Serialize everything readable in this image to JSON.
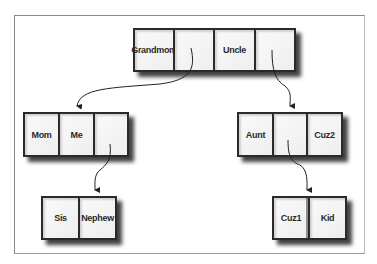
{
  "diagram": {
    "nodes": [
      {
        "id": "grandmom",
        "cells": [
          "Grandmom",
          "",
          "Uncle",
          ""
        ]
      },
      {
        "id": "mom",
        "cells": [
          "Mom",
          "Me",
          ""
        ]
      },
      {
        "id": "aunt",
        "cells": [
          "Aunt",
          "",
          "Cuz2"
        ]
      },
      {
        "id": "sis",
        "cells": [
          "Sis",
          "Nephew"
        ]
      },
      {
        "id": "cuz1",
        "cells": [
          "Cuz1",
          "Kid"
        ]
      }
    ],
    "edges": [
      {
        "from": "grandmom.cell2",
        "to": "mom"
      },
      {
        "from": "grandmom.cell4",
        "to": "aunt"
      },
      {
        "from": "mom.cell3",
        "to": "sis"
      },
      {
        "from": "aunt.cell2",
        "to": "cuz1"
      }
    ]
  }
}
